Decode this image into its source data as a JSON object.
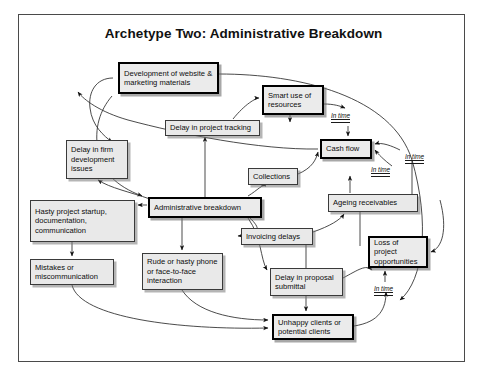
{
  "diagram": {
    "title": "Archetype Two: Administrative Breakdown",
    "type": "causal-loop-diagram",
    "nodes": [
      {
        "id": "development",
        "label": "Development of website & marketing materials",
        "emphasis": "bold",
        "x": 118,
        "y": 62,
        "w": 101,
        "h": 32
      },
      {
        "id": "smart_use",
        "label": "Smart use of resources",
        "emphasis": "bold",
        "x": 262,
        "y": 85,
        "w": 62,
        "h": 30
      },
      {
        "id": "delay_track",
        "label": "Delay in project tracking",
        "emphasis": "normal",
        "x": 165,
        "y": 120,
        "w": 95,
        "h": 16
      },
      {
        "id": "cash_flow",
        "label": "Cash flow",
        "emphasis": "bold",
        "x": 320,
        "y": 139,
        "w": 52,
        "h": 20
      },
      {
        "id": "delay_firm",
        "label": "Delay in firm development issues",
        "emphasis": "normal",
        "x": 66,
        "y": 140,
        "w": 62,
        "h": 39
      },
      {
        "id": "collections",
        "label": "Collections",
        "emphasis": "normal",
        "x": 248,
        "y": 168,
        "w": 50,
        "h": 17
      },
      {
        "id": "ageing",
        "label": "Ageing receivables",
        "emphasis": "normal",
        "x": 328,
        "y": 194,
        "w": 90,
        "h": 18
      },
      {
        "id": "admin_break",
        "label": "Administrative breakdown",
        "emphasis": "bold",
        "x": 148,
        "y": 197,
        "w": 114,
        "h": 21
      },
      {
        "id": "hasty_start",
        "label": "Hasty project startup, documentation, communication",
        "emphasis": "normal",
        "x": 30,
        "y": 200,
        "w": 105,
        "h": 42
      },
      {
        "id": "invoicing",
        "label": "Invoicing delays",
        "emphasis": "normal",
        "x": 241,
        "y": 228,
        "w": 72,
        "h": 17
      },
      {
        "id": "loss_proj",
        "label": "Loss of project opportunities",
        "emphasis": "bold",
        "x": 368,
        "y": 236,
        "w": 60,
        "h": 32
      },
      {
        "id": "mistakes",
        "label": "Mistakes or miscommunication",
        "emphasis": "normal",
        "x": 30,
        "y": 259,
        "w": 84,
        "h": 26
      },
      {
        "id": "rude",
        "label": "Rude or hasty phone or face-to-face interaction",
        "emphasis": "normal",
        "x": 142,
        "y": 253,
        "w": 81,
        "h": 37
      },
      {
        "id": "delay_prop",
        "label": "Delay in proposal submittal",
        "emphasis": "normal",
        "x": 270,
        "y": 268,
        "w": 73,
        "h": 28
      },
      {
        "id": "unhappy",
        "label": "Unhappy clients or potential clients",
        "emphasis": "bold",
        "x": 272,
        "y": 314,
        "w": 82,
        "h": 26
      }
    ],
    "delay_markers": [
      {
        "label": "In time",
        "x": 331,
        "y": 112
      },
      {
        "label": "In time",
        "x": 371,
        "y": 166
      },
      {
        "label": "In time",
        "x": 405,
        "y": 153
      },
      {
        "label": "In time",
        "x": 374,
        "y": 285
      }
    ]
  }
}
